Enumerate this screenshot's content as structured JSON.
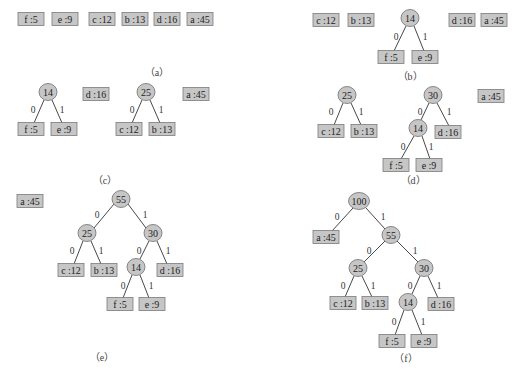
{
  "figure": {
    "colors": {
      "node_fill": "#c6c6c6",
      "node_stroke": "#7a7a7a",
      "edge": "#333333",
      "text": "#222222"
    },
    "panels": [
      {
        "id": "a",
        "caption": "（a）",
        "caption_pos": [
          157,
          72
        ],
        "leaves": [
          {
            "label": "f :5",
            "x": 31,
            "y": 19,
            "w": 26
          },
          {
            "label": "e :9",
            "x": 65,
            "y": 19,
            "w": 26
          },
          {
            "label": "c :12",
            "x": 102,
            "y": 19,
            "w": 26
          },
          {
            "label": "b :13",
            "x": 135,
            "y": 19,
            "w": 26
          },
          {
            "label": "d :16",
            "x": 167,
            "y": 19,
            "w": 26
          },
          {
            "label": "a :45",
            "x": 200,
            "y": 19,
            "w": 26
          }
        ],
        "inner": [],
        "edges": []
      },
      {
        "id": "b",
        "caption": "（b）",
        "caption_pos": [
          410,
          76
        ],
        "leaves": [
          {
            "label": "c :12",
            "x": 326,
            "y": 20,
            "w": 26
          },
          {
            "label": "b :13",
            "x": 361,
            "y": 20,
            "w": 26
          },
          {
            "label": "f :5",
            "x": 391,
            "y": 57,
            "w": 26
          },
          {
            "label": "e :9",
            "x": 425,
            "y": 57,
            "w": 26
          },
          {
            "label": "d :16",
            "x": 462,
            "y": 20,
            "w": 26
          },
          {
            "label": "a :45",
            "x": 494,
            "y": 20,
            "w": 26
          }
        ],
        "inner": [
          {
            "label": "14",
            "x": 410,
            "y": 18
          }
        ],
        "edges": [
          {
            "x1": 406,
            "y1": 26,
            "x2": 394,
            "y2": 51,
            "label": "0",
            "lx": 396,
            "ly": 37
          },
          {
            "x1": 414,
            "y1": 26,
            "x2": 424,
            "y2": 51,
            "label": "1",
            "lx": 425,
            "ly": 37
          }
        ]
      },
      {
        "id": "c",
        "caption": "（c）",
        "caption_pos": [
          105,
          180
        ],
        "leaves": [
          {
            "label": "f :5",
            "x": 31,
            "y": 129,
            "w": 26
          },
          {
            "label": "e :9",
            "x": 64,
            "y": 129,
            "w": 26
          },
          {
            "label": "d :16",
            "x": 96,
            "y": 94,
            "w": 26
          },
          {
            "label": "c :12",
            "x": 129,
            "y": 129,
            "w": 26
          },
          {
            "label": "b :13",
            "x": 162,
            "y": 129,
            "w": 26
          },
          {
            "label": "a :45",
            "x": 196,
            "y": 94,
            "w": 26
          }
        ],
        "inner": [
          {
            "label": "14",
            "x": 48,
            "y": 92
          },
          {
            "label": "25",
            "x": 146,
            "y": 92
          }
        ],
        "edges": [
          {
            "x1": 44,
            "y1": 100,
            "x2": 34,
            "y2": 123,
            "label": "0",
            "lx": 33,
            "ly": 110
          },
          {
            "x1": 52,
            "y1": 100,
            "x2": 62,
            "y2": 123,
            "label": "1",
            "lx": 62,
            "ly": 110
          },
          {
            "x1": 142,
            "y1": 100,
            "x2": 132,
            "y2": 123,
            "label": "0",
            "lx": 132,
            "ly": 110
          },
          {
            "x1": 150,
            "y1": 100,
            "x2": 160,
            "y2": 123,
            "label": "1",
            "lx": 161,
            "ly": 110
          }
        ]
      },
      {
        "id": "d",
        "caption": "（d）",
        "caption_pos": [
          413,
          180
        ],
        "leaves": [
          {
            "label": "c :12",
            "x": 331,
            "y": 131,
            "w": 26
          },
          {
            "label": "b :13",
            "x": 364,
            "y": 131,
            "w": 26
          },
          {
            "label": "d :16",
            "x": 448,
            "y": 132,
            "w": 26
          },
          {
            "label": "f :5",
            "x": 396,
            "y": 165,
            "w": 26
          },
          {
            "label": "e :9",
            "x": 429,
            "y": 165,
            "w": 26
          },
          {
            "label": "a :45",
            "x": 491,
            "y": 96,
            "w": 26
          }
        ],
        "inner": [
          {
            "label": "25",
            "x": 347,
            "y": 95
          },
          {
            "label": "30",
            "x": 433,
            "y": 95
          },
          {
            "label": "14",
            "x": 418,
            "y": 128
          }
        ],
        "edges": [
          {
            "x1": 343,
            "y1": 103,
            "x2": 334,
            "y2": 125,
            "label": "0",
            "lx": 331,
            "ly": 112
          },
          {
            "x1": 351,
            "y1": 103,
            "x2": 361,
            "y2": 125,
            "label": "1",
            "lx": 361,
            "ly": 112
          },
          {
            "x1": 429,
            "y1": 103,
            "x2": 421,
            "y2": 120,
            "label": "0",
            "lx": 420,
            "ly": 112
          },
          {
            "x1": 437,
            "y1": 103,
            "x2": 449,
            "y2": 126,
            "label": "1",
            "lx": 449,
            "ly": 112
          },
          {
            "x1": 414,
            "y1": 136,
            "x2": 401,
            "y2": 159,
            "label": "0",
            "lx": 403,
            "ly": 147
          },
          {
            "x1": 422,
            "y1": 136,
            "x2": 430,
            "y2": 159,
            "label": "1",
            "lx": 431,
            "ly": 147
          }
        ]
      },
      {
        "id": "e",
        "caption": "（e）",
        "caption_pos": [
          102,
          357
        ],
        "leaves": [
          {
            "label": "a :45",
            "x": 30,
            "y": 201,
            "w": 26
          },
          {
            "label": "c :12",
            "x": 71,
            "y": 270,
            "w": 26
          },
          {
            "label": "b :13",
            "x": 104,
            "y": 270,
            "w": 26
          },
          {
            "label": "d :16",
            "x": 170,
            "y": 270,
            "w": 26
          },
          {
            "label": "f :5",
            "x": 120,
            "y": 304,
            "w": 26
          },
          {
            "label": "e :9",
            "x": 152,
            "y": 304,
            "w": 26
          }
        ],
        "inner": [
          {
            "label": "55",
            "x": 121,
            "y": 199
          },
          {
            "label": "25",
            "x": 87,
            "y": 233
          },
          {
            "label": "30",
            "x": 153,
            "y": 233
          },
          {
            "label": "14",
            "x": 136,
            "y": 267
          }
        ],
        "edges": [
          {
            "x1": 114,
            "y1": 204,
            "x2": 94,
            "y2": 228,
            "label": "0",
            "lx": 97,
            "ly": 215
          },
          {
            "x1": 128,
            "y1": 204,
            "x2": 146,
            "y2": 228,
            "label": "1",
            "lx": 145,
            "ly": 215
          },
          {
            "x1": 83,
            "y1": 241,
            "x2": 74,
            "y2": 264,
            "label": "0",
            "lx": 72,
            "ly": 251
          },
          {
            "x1": 91,
            "y1": 241,
            "x2": 101,
            "y2": 264,
            "label": "1",
            "lx": 101,
            "ly": 251
          },
          {
            "x1": 149,
            "y1": 241,
            "x2": 140,
            "y2": 259,
            "label": "0",
            "lx": 139,
            "ly": 251
          },
          {
            "x1": 157,
            "y1": 241,
            "x2": 167,
            "y2": 264,
            "label": "1",
            "lx": 168,
            "ly": 251
          },
          {
            "x1": 132,
            "y1": 275,
            "x2": 123,
            "y2": 298,
            "label": "0",
            "lx": 123,
            "ly": 286
          },
          {
            "x1": 140,
            "y1": 275,
            "x2": 149,
            "y2": 298,
            "label": "1",
            "lx": 151,
            "ly": 286
          }
        ]
      },
      {
        "id": "f",
        "caption": "（f）",
        "caption_pos": [
          406,
          358
        ],
        "leaves": [
          {
            "label": "a :45",
            "x": 326,
            "y": 237,
            "w": 26
          },
          {
            "label": "c :12",
            "x": 343,
            "y": 303,
            "w": 26
          },
          {
            "label": "b :13",
            "x": 375,
            "y": 303,
            "w": 26
          },
          {
            "label": "d :16",
            "x": 441,
            "y": 304,
            "w": 26
          },
          {
            "label": "f :5",
            "x": 392,
            "y": 341,
            "w": 26
          },
          {
            "label": "e :9",
            "x": 424,
            "y": 341,
            "w": 26
          }
        ],
        "inner": [
          {
            "label": "100",
            "x": 359,
            "y": 201
          },
          {
            "label": "55",
            "x": 391,
            "y": 235
          },
          {
            "label": "25",
            "x": 358,
            "y": 268
          },
          {
            "label": "30",
            "x": 424,
            "y": 268
          },
          {
            "label": "14",
            "x": 408,
            "y": 302
          }
        ],
        "edges": [
          {
            "x1": 353,
            "y1": 208,
            "x2": 332,
            "y2": 231,
            "label": "0",
            "lx": 337,
            "ly": 217
          },
          {
            "x1": 366,
            "y1": 208,
            "x2": 385,
            "y2": 229,
            "label": "1",
            "lx": 383,
            "ly": 217
          },
          {
            "x1": 385,
            "y1": 241,
            "x2": 364,
            "y2": 262,
            "label": "0",
            "lx": 369,
            "ly": 251
          },
          {
            "x1": 397,
            "y1": 241,
            "x2": 418,
            "y2": 262,
            "label": "1",
            "lx": 415,
            "ly": 251
          },
          {
            "x1": 354,
            "y1": 276,
            "x2": 345,
            "y2": 297,
            "label": "0",
            "lx": 343,
            "ly": 286
          },
          {
            "x1": 362,
            "y1": 276,
            "x2": 372,
            "y2": 297,
            "label": "1",
            "lx": 373,
            "ly": 286
          },
          {
            "x1": 420,
            "y1": 276,
            "x2": 412,
            "y2": 294,
            "label": "0",
            "lx": 410,
            "ly": 286
          },
          {
            "x1": 428,
            "y1": 276,
            "x2": 438,
            "y2": 298,
            "label": "1",
            "lx": 439,
            "ly": 286
          },
          {
            "x1": 404,
            "y1": 310,
            "x2": 395,
            "y2": 335,
            "label": "0",
            "lx": 394,
            "ly": 322
          },
          {
            "x1": 412,
            "y1": 310,
            "x2": 422,
            "y2": 335,
            "label": "1",
            "lx": 423,
            "ly": 322
          }
        ]
      }
    ]
  }
}
